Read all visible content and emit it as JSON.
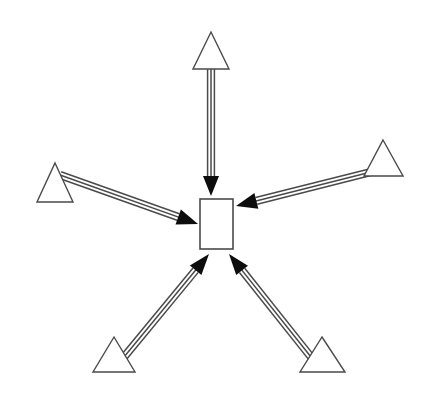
{
  "diagram": {
    "type": "star-topology",
    "background_color": "#ffffff",
    "stroke_color": "#4a4a4a",
    "arrowhead_color": "#0d0d0d",
    "node_fill_color": "#ffffff",
    "canvas": {
      "width": 429,
      "height": 403
    },
    "hub": {
      "id": "hub",
      "shape": "rectangle",
      "label": "",
      "x": 200,
      "y": 199,
      "width": 33,
      "height": 50,
      "stroke_width": 1.6
    },
    "spokes": [
      {
        "id": "spoke-top",
        "shape": "triangle",
        "label": "",
        "position": "top",
        "apex": {
          "x": 211,
          "y": 32
        },
        "base_left": {
          "x": 193,
          "y": 69
        },
        "base_right": {
          "x": 229,
          "y": 69
        },
        "stroke_width": 1.4
      },
      {
        "id": "spoke-left",
        "shape": "triangle",
        "label": "",
        "position": "left",
        "apex": {
          "x": 55,
          "y": 163
        },
        "base_left": {
          "x": 37,
          "y": 202
        },
        "base_right": {
          "x": 73,
          "y": 202
        },
        "stroke_width": 1.4
      },
      {
        "id": "spoke-right",
        "shape": "triangle",
        "label": "",
        "position": "right",
        "apex": {
          "x": 383,
          "y": 140
        },
        "base_left": {
          "x": 364,
          "y": 176
        },
        "base_right": {
          "x": 403,
          "y": 176
        },
        "stroke_width": 1.4
      },
      {
        "id": "spoke-bottom-left",
        "shape": "triangle",
        "label": "",
        "position": "bottom-left",
        "apex": {
          "x": 114,
          "y": 337
        },
        "base_left": {
          "x": 93,
          "y": 372
        },
        "base_right": {
          "x": 135,
          "y": 372
        },
        "stroke_width": 1.4
      },
      {
        "id": "spoke-bottom-right",
        "shape": "triangle",
        "label": "",
        "position": "bottom-right",
        "apex": {
          "x": 322,
          "y": 337
        },
        "base_left": {
          "x": 300,
          "y": 372
        },
        "base_right": {
          "x": 345,
          "y": 372
        },
        "stroke_width": 1.4
      }
    ],
    "edges": [
      {
        "id": "edge-top-to-hub",
        "from": "spoke-top",
        "to": "hub",
        "label": "",
        "direction": "inbound",
        "style": "triple-line",
        "line_count": 3,
        "line_gap": 3.4,
        "start": {
          "x": 211,
          "y": 66
        },
        "end": {
          "x": 211,
          "y": 196
        },
        "head_length": 20,
        "head_half_width": 8
      },
      {
        "id": "edge-left-to-hub",
        "from": "spoke-left",
        "to": "hub",
        "label": "",
        "direction": "inbound",
        "style": "triple-line",
        "line_count": 3,
        "line_gap": 3.4,
        "start": {
          "x": 60,
          "y": 175
        },
        "end": {
          "x": 198,
          "y": 224
        },
        "head_length": 21,
        "head_half_width": 8
      },
      {
        "id": "edge-right-to-hub",
        "from": "spoke-right",
        "to": "hub",
        "label": "",
        "direction": "inbound",
        "style": "triple-line",
        "line_count": 3,
        "line_gap": 3.4,
        "start": {
          "x": 371,
          "y": 172
        },
        "end": {
          "x": 236,
          "y": 206
        },
        "head_length": 21,
        "head_half_width": 8
      },
      {
        "id": "edge-bottom-left-to-hub",
        "from": "spoke-bottom-left",
        "to": "hub",
        "label": "",
        "direction": "inbound",
        "style": "triple-line",
        "line_count": 3,
        "line_gap": 3.4,
        "start": {
          "x": 124,
          "y": 357
        },
        "end": {
          "x": 209,
          "y": 254
        },
        "head_length": 21,
        "head_half_width": 7.5
      },
      {
        "id": "edge-bottom-right-to-hub",
        "from": "spoke-bottom-right",
        "to": "hub",
        "label": "",
        "direction": "inbound",
        "style": "triple-line",
        "line_count": 3,
        "line_gap": 3.4,
        "start": {
          "x": 311,
          "y": 357
        },
        "end": {
          "x": 229,
          "y": 254
        },
        "head_length": 21,
        "head_half_width": 7.5
      }
    ]
  }
}
